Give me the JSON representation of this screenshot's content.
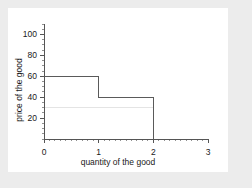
{
  "chart_data": {
    "type": "line",
    "subtype": "step",
    "title": "",
    "xlabel": "quantity of the good",
    "ylabel": "price of the good",
    "xlim": [
      0,
      3
    ],
    "ylim": [
      0,
      110
    ],
    "xticks": [
      "0",
      "1",
      "2",
      "3"
    ],
    "xtick_values": [
      0,
      1,
      2,
      3
    ],
    "yticks": [
      "20",
      "40",
      "60",
      "80",
      "100"
    ],
    "ytick_values": [
      20,
      40,
      60,
      80,
      100
    ],
    "grid": false,
    "legend": null,
    "minor_ticks": true,
    "series": [
      {
        "name": "demand step curve",
        "style": "step-post",
        "color": "#5a5a5a",
        "points": [
          {
            "x": 0,
            "y": 60
          },
          {
            "x": 1,
            "y": 60
          },
          {
            "x": 1,
            "y": 40
          },
          {
            "x": 2,
            "y": 40
          },
          {
            "x": 2,
            "y": 0
          }
        ],
        "steps": [
          {
            "x_start": 0,
            "x_end": 1,
            "price": 60
          },
          {
            "x_start": 1,
            "x_end": 2,
            "price": 40
          }
        ]
      },
      {
        "name": "reference line",
        "style": "horizontal",
        "color": "#e4e4e4",
        "y": 30,
        "x_start": 0,
        "x_end": 2
      }
    ]
  },
  "canvas": {
    "background": "#ececec",
    "plot_background": "#ffffff",
    "axis_color": "#555555"
  }
}
